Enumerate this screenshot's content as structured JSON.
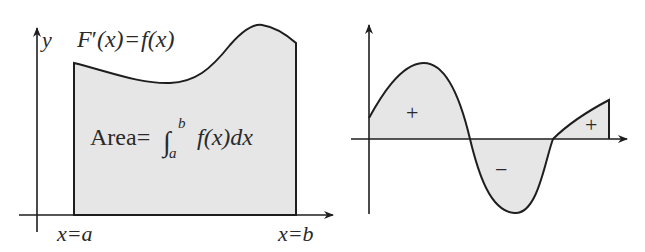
{
  "left_diagram": {
    "y_axis_label": "y",
    "equation": {
      "lhs_F": "F",
      "prime": "′",
      "lhs_args": "(x)",
      "equals": "=",
      "rhs_f": "f",
      "rhs_args": "(x)"
    },
    "area_label": {
      "word": "Area",
      "equals": "=",
      "integral": "∫",
      "upper": "b",
      "lower": "a",
      "integrand_f": "f",
      "integrand_args": "(x)",
      "dx": "dx"
    },
    "x_labels": {
      "left": "x=a",
      "right": "x=b"
    }
  },
  "right_diagram": {
    "region_signs": [
      "+",
      "−",
      "+"
    ]
  },
  "colors": {
    "stroke": "#1e1e1e",
    "fill": "#e6e6e6",
    "text": "#2a2a2a",
    "background": "#ffffff"
  }
}
